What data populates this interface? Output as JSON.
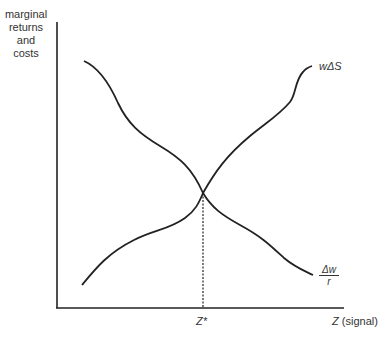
{
  "diagram": {
    "y_axis_label": [
      "marginal",
      "returns",
      "and",
      "costs"
    ],
    "x_axis_label": "Z (signal)",
    "x_axis_label_var": "Z",
    "x_axis_label_text": "(signal)",
    "equilibrium_label": "Z*",
    "curves": [
      {
        "name": "marginal-return",
        "label": "wΔS",
        "shape": "increasing"
      },
      {
        "name": "marginal-cost",
        "label_numerator": "Δw",
        "label_denominator": "r",
        "shape": "decreasing"
      }
    ],
    "line_color": "#222222"
  }
}
